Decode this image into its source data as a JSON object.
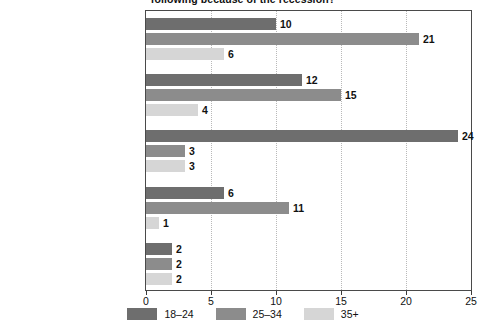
{
  "chart_data": {
    "type": "bar",
    "orientation": "horizontal",
    "title": "following because of the recession?",
    "xlabel": "",
    "ylabel": "",
    "xlim": [
      0,
      25
    ],
    "xticks": [
      0,
      5,
      10,
      15,
      20,
      25
    ],
    "xtick_labels": [
      "0",
      "5",
      "10",
      "15",
      "20",
      "25"
    ],
    "grid": "vertical-dotted",
    "legend_position": "bottom-center",
    "categories": [
      "Postponed getting married",
      "Postponed having a baby",
      "Moved in with a room mate",
      "Moved back in with parents",
      "Took in a boarder"
    ],
    "series": [
      {
        "name": "18–24",
        "color": "#6e6e6e",
        "values": [
          10,
          12,
          24,
          6,
          2
        ],
        "labels": [
          "10",
          "12",
          "24",
          "6",
          "2"
        ]
      },
      {
        "name": "25–34",
        "color": "#8c8c8c",
        "values": [
          21,
          15,
          3,
          11,
          2
        ],
        "labels": [
          "21",
          "15",
          "3",
          "11",
          "2"
        ]
      },
      {
        "name": "35+",
        "color": "#d6d6d6",
        "values": [
          6,
          4,
          3,
          1,
          2
        ],
        "labels": [
          "6",
          "4",
          "3",
          "1",
          "2"
        ]
      }
    ]
  },
  "axis": {
    "tick_0": "0",
    "tick_1": "5",
    "tick_2": "10",
    "tick_3": "15",
    "tick_4": "20",
    "tick_5": "25"
  },
  "legend": {
    "items": [
      {
        "label": "18–24",
        "color": "#6e6e6e"
      },
      {
        "label": "25–34",
        "color": "#8c8c8c"
      },
      {
        "label": "35+",
        "color": "#d6d6d6"
      }
    ]
  },
  "colors": {
    "series_18_24": "#6e6e6e",
    "series_25_34": "#8c8c8c",
    "series_35_plus": "#d6d6d6",
    "axis": "#4a4a4a",
    "gridline": "#b9b9b9",
    "text": "#111111",
    "background": "#ffffff"
  }
}
